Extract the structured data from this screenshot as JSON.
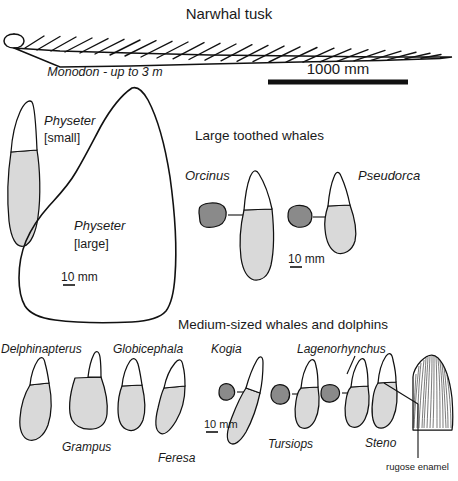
{
  "figure": {
    "title": "Narwhal tusk",
    "colors": {
      "outline": "#111111",
      "root_fill": "#d9d9d9",
      "crown_fill": "#ffffff",
      "cross_section_fill": "#8a8a8a",
      "background": "#ffffff"
    }
  },
  "tusk_section": {
    "title": "Narwhal tusk",
    "caption": "Monodon - up to 3 m",
    "scale_label": "1000 mm"
  },
  "sperm_whale_section": {
    "small_label_line1": "Physeter",
    "small_label_line2": "[small]",
    "large_label_line1": "Physeter",
    "large_label_line2": "[large]",
    "scale_label": "10 mm"
  },
  "large_toothed_section": {
    "heading": "Large toothed whales",
    "scale_label": "10 mm",
    "specimens": [
      {
        "name": "Orcinus",
        "has_cross_section": true
      },
      {
        "name": "Pseudorca",
        "has_cross_section": true
      }
    ]
  },
  "medium_section": {
    "heading": "Medium-sized whales and dolphins",
    "scale_label": "10 mm",
    "annotation": "rugose enamel",
    "specimens": [
      {
        "name": "Delphinapterus",
        "has_cross_section": false
      },
      {
        "name": "Grampus",
        "has_cross_section": false
      },
      {
        "name": "Globicephala",
        "has_cross_section": false
      },
      {
        "name": "Feresa",
        "has_cross_section": false
      },
      {
        "name": "Kogia",
        "has_cross_section": true
      },
      {
        "name": "Tursiops",
        "has_cross_section": true
      },
      {
        "name": "Lagenorhynchus",
        "has_cross_section": true
      },
      {
        "name": "Steno",
        "has_cross_section": false
      }
    ]
  },
  "bottom_section": {
    "heading": "Small dolphins and porpoises"
  }
}
